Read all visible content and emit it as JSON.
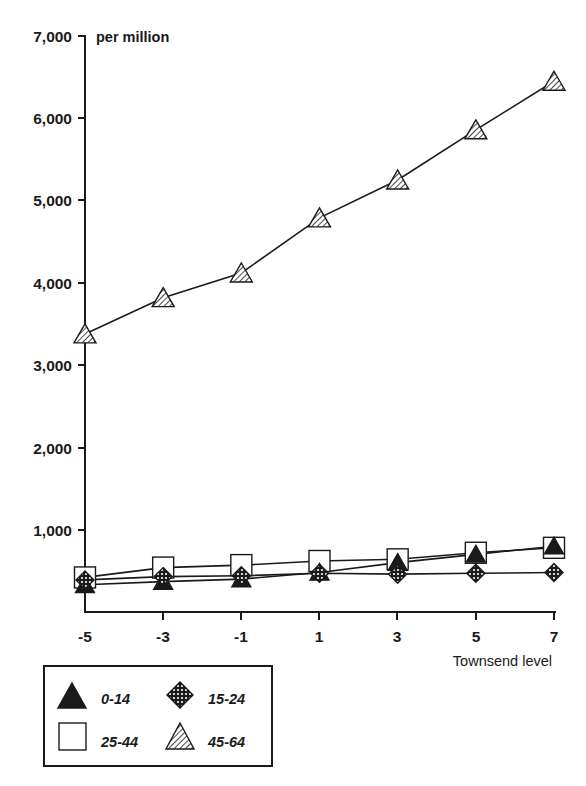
{
  "chart": {
    "unit_label": "per million",
    "xlabel": "Townsend level",
    "ylabel": "",
    "y_ticks": [
      "1,000",
      "2,000",
      "3,000",
      "4,000",
      "5,000",
      "6,000",
      "7,000"
    ],
    "x_ticks": [
      "-5",
      "-3",
      "-1",
      "1",
      "3",
      "5",
      "7"
    ]
  },
  "legend": {
    "items": [
      {
        "label": "0-14",
        "marker": "filled-triangle"
      },
      {
        "label": "15-24",
        "marker": "hatched-diamond"
      },
      {
        "label": "25-44",
        "marker": "open-square"
      },
      {
        "label": "45-64",
        "marker": "striped-triangle"
      }
    ]
  },
  "chart_data": {
    "type": "line",
    "title": "",
    "xlabel": "Townsend level",
    "ylabel": "per million",
    "x": [
      -5,
      -3,
      -1,
      1,
      3,
      5,
      7
    ],
    "xlim": [
      -6,
      8
    ],
    "ylim": [
      0,
      7000
    ],
    "y_ticks": [
      1000,
      2000,
      3000,
      4000,
      5000,
      6000,
      7000
    ],
    "grid": false,
    "legend_position": "bottom-left",
    "series": [
      {
        "name": "0-14",
        "marker": "filled-triangle",
        "values": [
          330,
          370,
          400,
          480,
          600,
          700,
          800
        ]
      },
      {
        "name": "15-24",
        "marker": "hatched-diamond",
        "values": [
          390,
          430,
          440,
          470,
          460,
          470,
          480
        ]
      },
      {
        "name": "25-44",
        "marker": "open-square",
        "values": [
          420,
          540,
          570,
          620,
          640,
          720,
          780
        ]
      },
      {
        "name": "45-64",
        "marker": "striped-triangle",
        "values": [
          3380,
          3820,
          4120,
          4790,
          5250,
          5860,
          6450
        ]
      }
    ]
  }
}
